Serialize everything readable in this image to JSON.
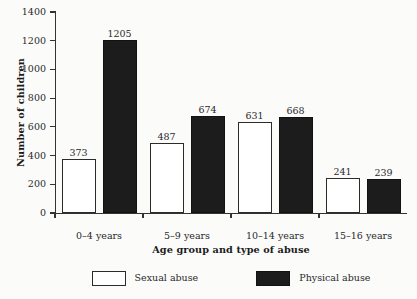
{
  "chart_data": {
    "type": "bar",
    "title": "",
    "xlabel": "Age group and type of abuse",
    "ylabel": "Number of children",
    "categories": [
      "0–4 years",
      "5–9 years",
      "10–14 years",
      "15–16 years"
    ],
    "series": [
      {
        "name": "Sexual abuse",
        "values": [
          373,
          487,
          631,
          241
        ],
        "color": "#ffffff"
      },
      {
        "name": "Physical abuse",
        "values": [
          1205,
          674,
          668,
          239
        ],
        "color": "#1c1c1c"
      }
    ],
    "ylim": [
      0,
      1400
    ],
    "yticks": [
      0,
      200,
      400,
      600,
      800,
      1000,
      1200,
      1400
    ],
    "ytick_labels": [
      "0",
      "200",
      "400",
      "600",
      "800",
      "1000",
      "1200",
      "1400"
    ],
    "grid": false,
    "legend_position": "bottom",
    "data_labels": true,
    "data_label_values": [
      "373",
      "1205",
      "487",
      "674",
      "631",
      "668",
      "241",
      "239"
    ]
  },
  "legend": {
    "items": [
      {
        "label": "Sexual abuse",
        "swatch": "open-square-swatch"
      },
      {
        "label": "Physical abuse",
        "swatch": "filled-square-swatch"
      }
    ]
  }
}
